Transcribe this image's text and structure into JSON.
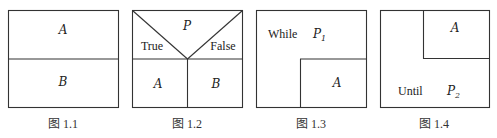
{
  "figures": [
    {
      "caption": "图 1.1",
      "labels": {
        "top": "A",
        "bottom": "B"
      }
    },
    {
      "caption": "图 1.2",
      "labels": {
        "condition": "P",
        "true_branch": "True",
        "false_branch": "False",
        "left": "A",
        "right": "B"
      }
    },
    {
      "caption": "图 1.3",
      "labels": {
        "keyword": "While",
        "condition": "P",
        "condition_subscript": "1",
        "body": "A"
      }
    },
    {
      "caption": "图 1.4",
      "labels": {
        "body": "A",
        "keyword": "Until",
        "condition": "P",
        "condition_subscript": "2"
      }
    }
  ]
}
